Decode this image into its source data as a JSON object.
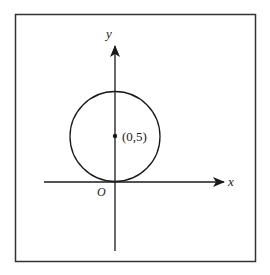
{
  "diagram": {
    "type": "coordinate-plane",
    "axes": {
      "x_label": "x",
      "y_label": "y",
      "origin_label": "O"
    },
    "circle": {
      "center_label": "(0,5)",
      "center": [
        0,
        5
      ],
      "radius": 5,
      "tangent_to": "x-axis at origin"
    },
    "colors": {
      "stroke": "#1a1a1a",
      "frame": "#333333",
      "background": "#ffffff"
    }
  }
}
